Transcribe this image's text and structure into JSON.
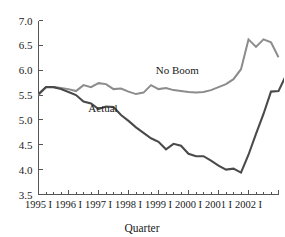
{
  "chart_data": {
    "type": "line",
    "title": "",
    "xlabel": "Quarter",
    "ylabel": "",
    "ylim": [
      3.5,
      7.0
    ],
    "ytick_values": [
      3.5,
      4.0,
      4.5,
      5.0,
      5.5,
      6.0,
      6.5,
      7.0
    ],
    "ytick_labels": [
      "3.5",
      "4.0",
      "4.5",
      "5.0",
      "5.5",
      "6.0",
      "6.5",
      "7.0"
    ],
    "grid": false,
    "legend_position": "inline-annotations",
    "x_major_labels": [
      "1995 I",
      "1996 I",
      "1997 I",
      "1998 I",
      "1999 I",
      "2000 I",
      "2001 I",
      "2002 I"
    ],
    "x_minor_per_major": 4,
    "x_total_points": 33,
    "x_categories": [
      "1995 I",
      "1995 II",
      "1995 III",
      "1995 IV",
      "1996 I",
      "1996 II",
      "1996 III",
      "1996 IV",
      "1997 I",
      "1997 II",
      "1997 III",
      "1997 IV",
      "1998 I",
      "1998 II",
      "1998 III",
      "1998 IV",
      "1999 I",
      "1999 II",
      "1999 III",
      "1999 IV",
      "2000 I",
      "2000 II",
      "2000 III",
      "2000 IV",
      "2001 I",
      "2001 II",
      "2001 III",
      "2001 IV",
      "2002 I",
      "2002 II",
      "2002 III",
      "2002 IV",
      "2003 I"
    ],
    "series": [
      {
        "name": "No Boom",
        "color": "#8c8c8c",
        "label_x_index": 18.5,
        "label_y_value": 5.93,
        "values": [
          5.5,
          5.66,
          5.66,
          5.64,
          5.62,
          5.58,
          5.7,
          5.66,
          5.74,
          5.72,
          5.62,
          5.63,
          5.57,
          5.52,
          5.55,
          5.7,
          5.62,
          5.64,
          5.6,
          5.58,
          5.56,
          5.55,
          5.56,
          5.6,
          5.66,
          5.72,
          5.82,
          6.02,
          6.62,
          6.47,
          6.62,
          6.56,
          6.26
        ]
      },
      {
        "name": "Actual",
        "color": "#4a4a4a",
        "label_x_index": 8.6,
        "label_y_value": 5.15,
        "values": [
          5.52,
          5.66,
          5.66,
          5.62,
          5.56,
          5.5,
          5.37,
          5.33,
          5.22,
          5.27,
          5.26,
          5.1,
          4.98,
          4.85,
          4.74,
          4.63,
          4.56,
          4.41,
          4.52,
          4.48,
          4.32,
          4.27,
          4.27,
          4.18,
          4.08,
          4.0,
          4.02,
          3.94,
          4.3,
          4.72,
          5.12,
          5.57,
          5.58,
          5.9,
          5.74
        ]
      }
    ],
    "annotations": [
      {
        "text": "No Boom"
      },
      {
        "text": "Actual"
      }
    ]
  },
  "axes": {
    "x_axis_title": "Quarter"
  }
}
